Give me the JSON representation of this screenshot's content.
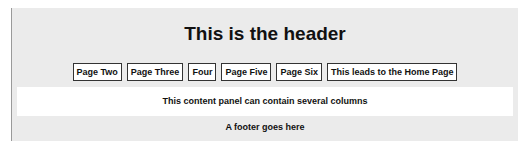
{
  "header": {
    "title": "This is the header"
  },
  "nav": {
    "items": [
      {
        "label": "Page Two"
      },
      {
        "label": "Page Three"
      },
      {
        "label": "Four"
      },
      {
        "label": "Page Five"
      },
      {
        "label": "Page Six"
      },
      {
        "label": "This leads to the Home Page"
      }
    ]
  },
  "content": {
    "text": "This content panel can contain several columns"
  },
  "footer": {
    "text": "A footer goes here"
  },
  "colors": {
    "page_background": "#ebebeb",
    "panel_background": "#ffffff",
    "button_border": "#333333",
    "text": "#111111"
  }
}
